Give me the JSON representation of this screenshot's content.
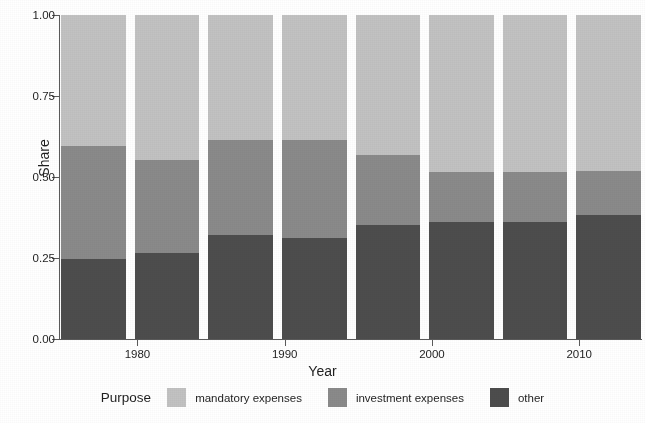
{
  "chart_data": {
    "type": "bar",
    "subtype": "stacked-100-percent",
    "title": "",
    "xlabel": "Year",
    "ylabel": "Share",
    "ylim": [
      0,
      1
    ],
    "yticks": [
      "0.00",
      "0.25",
      "0.50",
      "0.75",
      "1.00"
    ],
    "ytick_values": [
      0.0,
      0.25,
      0.5,
      0.75,
      1.0
    ],
    "xticks": [
      "1980",
      "1990",
      "2000",
      "2010"
    ],
    "xtick_values": [
      1980,
      1990,
      2000,
      2010
    ],
    "grid": false,
    "legend_position": "bottom",
    "legend_title": "Purpose",
    "categories": [
      1977,
      1982,
      1987,
      1992,
      1997,
      2002,
      2007,
      2012
    ],
    "series": [
      {
        "name": "mandatory expenses",
        "color": "#c2c2c2",
        "values": [
          0.405,
          0.448,
          0.386,
          0.386,
          0.432,
          0.485,
          0.485,
          0.481
        ]
      },
      {
        "name": "investment expenses",
        "color": "#8a8a8a",
        "values": [
          0.348,
          0.287,
          0.294,
          0.302,
          0.216,
          0.154,
          0.154,
          0.136
        ]
      },
      {
        "name": "other",
        "color": "#4d4d4d",
        "values": [
          0.247,
          0.265,
          0.32,
          0.312,
          0.352,
          0.361,
          0.361,
          0.383
        ]
      }
    ]
  },
  "axes": {
    "y_title": "Share",
    "x_title": "Year"
  },
  "legend": {
    "title": "Purpose",
    "items": [
      {
        "label": "mandatory expenses",
        "color": "#c2c2c2"
      },
      {
        "label": "investment expenses",
        "color": "#8a8a8a"
      },
      {
        "label": "other",
        "color": "#4d4d4d"
      }
    ]
  }
}
